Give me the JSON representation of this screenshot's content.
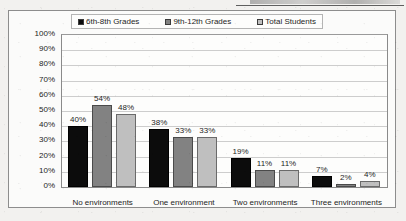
{
  "page": {
    "background_color": "#f2f1ef",
    "top_rule_color": "#5f5f5f"
  },
  "legend": {
    "position": "top",
    "items": [
      {
        "label": "6th-8th Grades",
        "color": "#0c0c0c",
        "icon": "legend-swatch-icon"
      },
      {
        "label": "9th-12th Grades",
        "color": "#828282",
        "icon": "legend-swatch-icon"
      },
      {
        "label": "Total Students",
        "color": "#bfbfbf",
        "icon": "legend-swatch-icon"
      }
    ]
  },
  "axes": {
    "y_tick_labels": [
      "100%",
      "90%",
      "80%",
      "70%",
      "60%",
      "50%",
      "40%",
      "30%",
      "20%",
      "10%",
      "0%"
    ]
  },
  "chart_data": {
    "type": "bar",
    "title": "",
    "xlabel": "",
    "ylabel": "",
    "ylim": [
      0,
      100
    ],
    "grid": true,
    "legend_position": "top",
    "value_suffix": "%",
    "categories": [
      "No environments",
      "One environment",
      "Two environments",
      "Three environments"
    ],
    "series": [
      {
        "name": "6th-8th Grades",
        "color": "#0c0c0c",
        "values": [
          40,
          38,
          19,
          7
        ]
      },
      {
        "name": "9th-12th Grades",
        "color": "#828282",
        "values": [
          54,
          33,
          11,
          2
        ]
      },
      {
        "name": "Total Students",
        "color": "#bfbfbf",
        "values": [
          48,
          33,
          11,
          4
        ]
      }
    ],
    "data_labels": [
      [
        "40%",
        "54%",
        "48%"
      ],
      [
        "38%",
        "33%",
        "33%"
      ],
      [
        "19%",
        "11%",
        "11%"
      ],
      [
        "7%",
        "2%",
        "4%"
      ]
    ]
  }
}
